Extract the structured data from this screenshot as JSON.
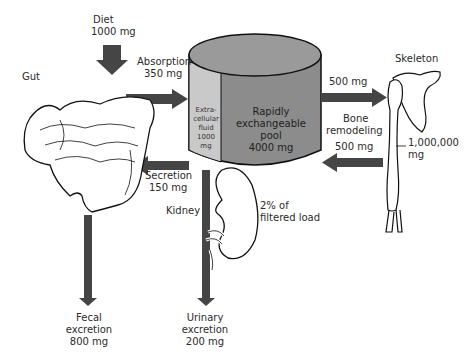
{
  "diagram": {
    "colors": {
      "arrow": "#454545",
      "cylinder_body": "#8c8c8c",
      "cylinder_top": "#9a9a9a",
      "ecf_panel": "#c9c9c9",
      "line": "#111111"
    },
    "diet": {
      "label": "Diet",
      "value": "1000 mg"
    },
    "gut": {
      "label": "Gut"
    },
    "absorption": {
      "label": "Absorption",
      "value": "350 mg"
    },
    "secretion": {
      "label": "Secretion",
      "value": "150 mg"
    },
    "fecal": {
      "line1": "Fecal",
      "line2": "excretion",
      "value": "800 mg"
    },
    "ecf": {
      "line1": "Extra-",
      "line2": "cellular",
      "line3": "fluid",
      "value": "1000",
      "unit": "mg"
    },
    "pool": {
      "line1": "Rapidly",
      "line2": "exchangeable",
      "line3": "pool",
      "value": "4000 mg"
    },
    "bone_out": {
      "value": "500 mg"
    },
    "bone_remodeling": {
      "line1": "Bone",
      "line2": "remodeling"
    },
    "bone_in": {
      "value": "500 mg"
    },
    "skeleton": {
      "label": "Skeleton",
      "value": "1,000,000",
      "unit": "mg"
    },
    "kidney": {
      "label": "Kidney",
      "note_line1": "2% of",
      "note_line2": "filtered load"
    },
    "urinary": {
      "line1": "Urinary",
      "line2": "excretion",
      "value": "200 mg"
    }
  }
}
